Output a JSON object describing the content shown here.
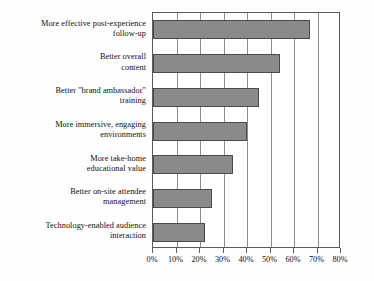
{
  "chart_data": {
    "type": "bar",
    "orientation": "horizontal",
    "title": "",
    "subtitle": "",
    "xlabel": "",
    "ylabel": "",
    "xlim": [
      0,
      80
    ],
    "xtick_labels": [
      "0%",
      "10%",
      "20%",
      "30%",
      "40%",
      "50%",
      "60%",
      "70%",
      "80%"
    ],
    "xtick_values": [
      0,
      10,
      20,
      30,
      40,
      50,
      60,
      70,
      80
    ],
    "grid": true,
    "legend": "none",
    "value_suffix": "%",
    "categories": [
      "More effective post-experience follow-up",
      "Better overall content",
      "Better \"brand ambassador\" training",
      "More immersive, engaging environments",
      "More take-home educational value",
      "Better on-site attendee management",
      "Technology-enabled audience interaction"
    ],
    "category_lines": [
      [
        "More effective post-experience",
        "follow-up"
      ],
      [
        "Better overall",
        "content"
      ],
      [
        "Better \"brand ambassador\"",
        "training"
      ],
      [
        "More immersive, engaging",
        "environments"
      ],
      [
        "More take-home",
        "educational value"
      ],
      [
        "Better on-site attendee",
        "management"
      ],
      [
        "Technology-enabled audience",
        "interaction"
      ]
    ],
    "values": [
      67,
      54,
      45,
      40,
      34,
      25,
      22
    ],
    "bar_color": "#8a8a8a",
    "bar_border_color": "#4a4a4a",
    "grid_color": "#8c8c8c",
    "axis_color": "#5a5a5a",
    "text_color": "#111111"
  }
}
